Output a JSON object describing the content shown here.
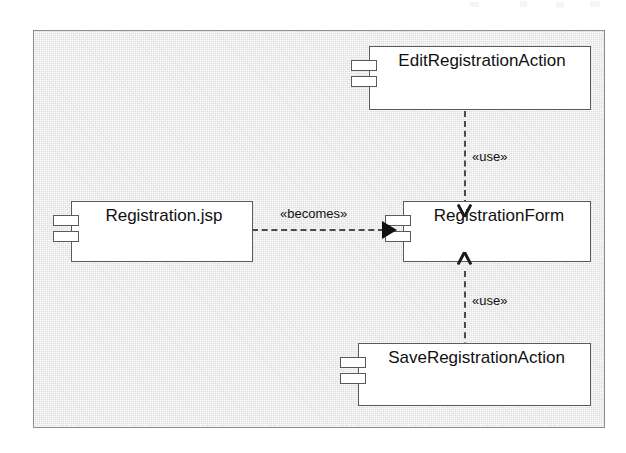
{
  "diagram": {
    "type": "uml-component-diagram",
    "frame": {
      "background_color": "#e2e2e2",
      "border_color": "#8d8d8d"
    },
    "components": [
      {
        "id": "edit-registration-action",
        "name": "EditRegistrationAction",
        "icon": "component-icon"
      },
      {
        "id": "registration-jsp",
        "name": "Registration.jsp",
        "icon": "component-icon"
      },
      {
        "id": "registration-form",
        "name": "RegistrationForm",
        "icon": "component-icon"
      },
      {
        "id": "save-registration-action",
        "name": "SaveRegistrationAction",
        "icon": "component-icon"
      }
    ],
    "connectors": [
      {
        "id": "edit-uses-form",
        "from": "EditRegistrationAction",
        "to": "RegistrationForm",
        "stereotype": "«use»",
        "line": "dashed",
        "arrow": "open",
        "direction": "down"
      },
      {
        "id": "jsp-becomes-form",
        "from": "Registration.jsp",
        "to": "RegistrationForm",
        "stereotype": "«becomes»",
        "line": "dashed",
        "arrow": "solid",
        "direction": "right"
      },
      {
        "id": "save-uses-form",
        "from": "SaveRegistrationAction",
        "to": "RegistrationForm",
        "stereotype": "«use»",
        "line": "dashed",
        "arrow": "open",
        "direction": "up"
      }
    ]
  }
}
